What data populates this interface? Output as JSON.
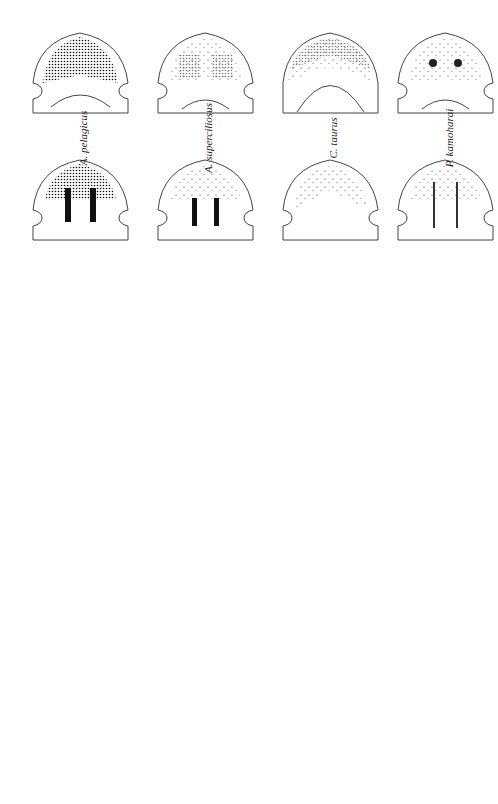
{
  "figure": {
    "orientation": "rotated-90-ccw",
    "species_top_row": [
      "A. pelagicus",
      "A. superciliosus",
      "C. taurus",
      "P. kamoharai"
    ],
    "species_bottom": [
      "G. cirratum",
      "P. schroederi"
    ],
    "views": {
      "top_dorsal": "Dorsal",
      "top_ventral": "Ventral",
      "bottom_dorsal": "Dorsal",
      "bottom_ventral": "Ventral"
    },
    "colors": {
      "ink": "#222222",
      "outline": "#444444",
      "background": "#ffffff"
    }
  }
}
